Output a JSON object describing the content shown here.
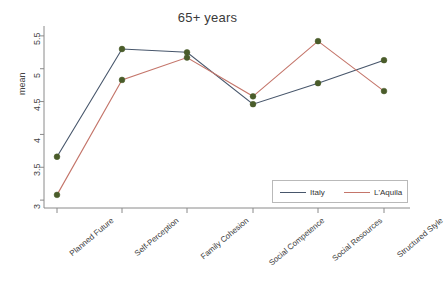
{
  "chart_data": {
    "type": "line",
    "title": "65+ years",
    "xlabel": "",
    "ylabel": "mean",
    "categories": [
      "Planned Future",
      "Self-Perception",
      "Family Cohesion",
      "Social Competence",
      "Social Resources",
      "Structured Style"
    ],
    "yticks": [
      "3",
      "3.5",
      "4",
      "4.5",
      "5",
      "5.5"
    ],
    "ytick_values": [
      3,
      3.5,
      4,
      4.5,
      5,
      5.5
    ],
    "ylim": [
      2.88,
      5.62
    ],
    "grid": false,
    "legend_position": "bottom-right",
    "markers": "filled-circle",
    "marker_color": "#4a5c2a",
    "series": [
      {
        "name": "Italy",
        "color": "#47566b",
        "values": [
          3.66,
          5.3,
          5.25,
          4.46,
          4.78,
          5.13
        ]
      },
      {
        "name": "L'Aquila",
        "color": "#c4756a",
        "values": [
          3.08,
          4.83,
          5.17,
          4.58,
          5.42,
          4.66
        ]
      }
    ]
  },
  "axis": {
    "ylabel": "mean"
  },
  "legend": {
    "items": [
      {
        "label": "Italy",
        "color": "#47566b"
      },
      {
        "label": "L'Aquila",
        "color": "#c4756a"
      }
    ]
  }
}
